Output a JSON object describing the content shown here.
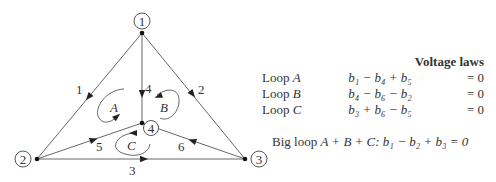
{
  "graph": {
    "nodes": [
      {
        "id": "1",
        "label": "1"
      },
      {
        "id": "2",
        "label": "2"
      },
      {
        "id": "3",
        "label": "3"
      },
      {
        "id": "4",
        "label": "4"
      }
    ],
    "edges": [
      {
        "id": "1",
        "label": "1",
        "from": "1",
        "to": "2"
      },
      {
        "id": "2",
        "label": "2",
        "from": "1",
        "to": "3"
      },
      {
        "id": "3",
        "label": "3",
        "from": "2",
        "to": "3"
      },
      {
        "id": "4",
        "label": "4",
        "from": "1",
        "to": "4"
      },
      {
        "id": "5",
        "label": "5",
        "from": "2",
        "to": "4"
      },
      {
        "id": "6",
        "label": "6",
        "from": "3",
        "to": "4"
      }
    ],
    "loops": [
      {
        "label": "A"
      },
      {
        "label": "B"
      },
      {
        "label": "C"
      }
    ]
  },
  "equations": {
    "title": "Voltage laws",
    "rows": [
      {
        "name": "Loop ",
        "loop": "A",
        "expr": "b₁ − b₄ + b₅",
        "rhs": "= 0"
      },
      {
        "name": "Loop ",
        "loop": "B",
        "expr": "b₄ − b₆ − b₂",
        "rhs": "= 0"
      },
      {
        "name": "Loop ",
        "loop": "C",
        "expr": "b₃ + b₆ − b₅",
        "rhs": "= 0"
      }
    ],
    "big_loop": {
      "prefix": "Big loop ",
      "loops": "A + B + C",
      "expr": ": b₁ − b₂ + b₃ = 0"
    }
  }
}
